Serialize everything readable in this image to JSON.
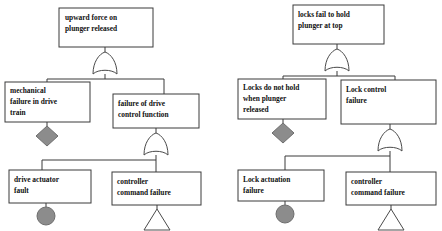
{
  "diagram": {
    "type": "fault-tree",
    "background_color": "#ffffff",
    "box_fill_color": "#ffffff",
    "box_stroke_color": "#3a3a3a",
    "symbol_fill_color": "#8c8c8c",
    "gate_fill_color": "#ffffff"
  },
  "trees": [
    {
      "id": "left-tree",
      "name": "upward-force-tree",
      "top_event": {
        "name": "top-event-upward-force",
        "lines": [
          "upward force on",
          "plunger released"
        ]
      },
      "gate_top": {
        "name": "or-gate-upward-force",
        "type": "OR"
      },
      "intermediate_events": [
        {
          "name": "event-mechanical-failure-drive-train",
          "lines": [
            "mechanical",
            "failure in drive",
            "train"
          ],
          "symbol": "diamond",
          "symbol_name": "undeveloped-event-diamond"
        },
        {
          "name": "event-failure-drive-control-function",
          "lines": [
            "failure of drive",
            "control function"
          ],
          "symbol": "or-gate",
          "symbol_name": "or-gate-drive-control"
        }
      ],
      "basic_events": [
        {
          "name": "event-drive-actuator-fault",
          "lines": [
            "drive actuator",
            "fault"
          ],
          "symbol": "circle",
          "symbol_name": "basic-event-circle"
        },
        {
          "name": "event-controller-command-failure",
          "lines": [
            "controller",
            "command failure"
          ],
          "symbol": "triangle",
          "symbol_name": "transfer-event-triangle"
        }
      ]
    },
    {
      "id": "right-tree",
      "name": "locks-fail-tree",
      "top_event": {
        "name": "top-event-locks-fail",
        "lines": [
          "locks fail to hold",
          "plunger at top"
        ]
      },
      "gate_top": {
        "name": "or-gate-locks-fail",
        "type": "OR"
      },
      "intermediate_events": [
        {
          "name": "event-locks-do-not-hold",
          "lines": [
            "Locks do not hold",
            "when plunger",
            "released"
          ],
          "symbol": "diamond",
          "symbol_name": "undeveloped-event-diamond"
        },
        {
          "name": "event-lock-control-failure",
          "lines": [
            "Lock control",
            "failure"
          ],
          "symbol": "or-gate",
          "symbol_name": "or-gate-lock-control"
        }
      ],
      "basic_events": [
        {
          "name": "event-lock-actuation-failure",
          "lines": [
            "Lock actuation",
            "failure"
          ],
          "symbol": "circle",
          "symbol_name": "basic-event-circle"
        },
        {
          "name": "event-controller-command-failure",
          "lines": [
            "controller",
            "command failure"
          ],
          "symbol": "triangle",
          "symbol_name": "transfer-event-triangle"
        }
      ]
    }
  ]
}
